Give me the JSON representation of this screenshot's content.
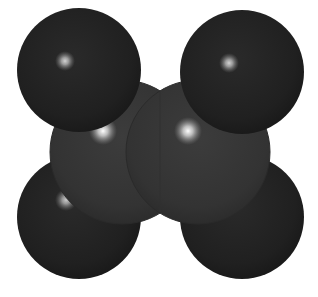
{
  "figure": {
    "molecule": "ethylene (C2H4)",
    "background_color": "#ffffff",
    "atoms": [
      {
        "id": "h-top-left",
        "element": "H",
        "cx": 79,
        "cy": 70,
        "r": 62,
        "color": "#222222",
        "highlight": [
          65,
          61
        ]
      },
      {
        "id": "h-top-right",
        "element": "H",
        "cx": 242,
        "cy": 72,
        "r": 62,
        "color": "#222222",
        "highlight": [
          229,
          63
        ]
      },
      {
        "id": "c-left",
        "element": "C",
        "cx": 120,
        "cy": 152,
        "r": 72,
        "color": "#363636",
        "highlight": [
          103,
          131
        ]
      },
      {
        "id": "c-right",
        "element": "C",
        "cx": 200,
        "cy": 152,
        "r": 72,
        "color": "#363636",
        "highlight": [
          188,
          131
        ]
      },
      {
        "id": "h-bottom-left",
        "element": "H",
        "cx": 79,
        "cy": 217,
        "r": 62,
        "color": "#222222",
        "highlight": [
          66,
          200
        ]
      },
      {
        "id": "h-bottom-right",
        "element": "H",
        "cx": 242,
        "cy": 217,
        "r": 62,
        "color": "#222222",
        "highlight": [
          229,
          203
        ]
      }
    ]
  }
}
